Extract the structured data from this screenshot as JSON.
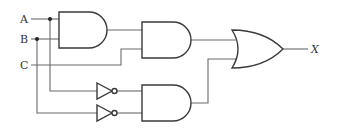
{
  "diagram": {
    "type": "logic-circuit",
    "inputs": [
      {
        "label": "A"
      },
      {
        "label": "B"
      },
      {
        "label": "C"
      }
    ],
    "output": {
      "label": "X"
    },
    "gates": [
      {
        "id": "and1",
        "type": "AND",
        "inputs": [
          "A",
          "B"
        ]
      },
      {
        "id": "and2",
        "type": "AND",
        "inputs": [
          "and1",
          "C"
        ]
      },
      {
        "id": "not1",
        "type": "NOT",
        "inputs": [
          "A"
        ]
      },
      {
        "id": "not2",
        "type": "NOT",
        "inputs": [
          "B"
        ]
      },
      {
        "id": "and3",
        "type": "AND",
        "inputs": [
          "not1",
          "not2"
        ]
      },
      {
        "id": "or1",
        "type": "OR",
        "inputs": [
          "and2",
          "and3"
        ]
      }
    ],
    "expression": "X = ABC + A'B'",
    "colors": {
      "wire": "#6b6b6b",
      "gate_stroke": "#3a3a3a",
      "background": "#ffffff"
    }
  }
}
